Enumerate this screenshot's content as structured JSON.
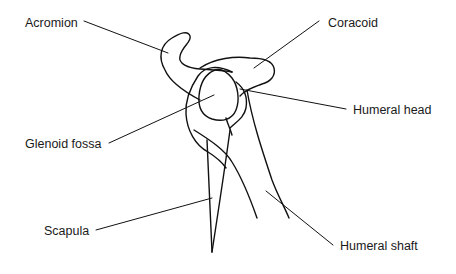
{
  "figure": {
    "labels": [
      {
        "id": "acromion",
        "text": "Acromion",
        "x": 25,
        "y": 17
      },
      {
        "id": "coracoid",
        "text": "Coracoid",
        "x": 328,
        "y": 17
      },
      {
        "id": "humeral_head",
        "text": "Humeral head",
        "x": 353,
        "y": 104
      },
      {
        "id": "glenoid_fossa",
        "text": "Glenoid fossa",
        "x": 25,
        "y": 138
      },
      {
        "id": "scapula",
        "text": "Scapula",
        "x": 44,
        "y": 225
      },
      {
        "id": "humeral_shaft",
        "text": "Humeral shaft",
        "x": 340,
        "y": 240
      }
    ],
    "colors": {
      "line": "#111111",
      "text": "#1a1a1a",
      "background": "#ffffff"
    }
  }
}
